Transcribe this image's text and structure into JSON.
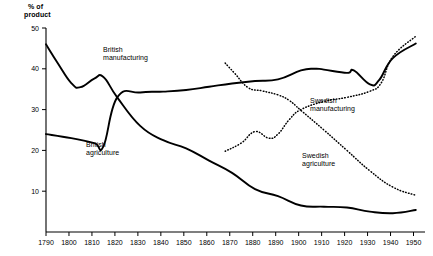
{
  "chart_data": {
    "type": "line",
    "title": "",
    "subtitle": "",
    "xlabel": "",
    "ylabel": "% of\nproduct",
    "ylabel_line1": "% of",
    "ylabel_line2": "product",
    "xlim": [
      1790,
      1955
    ],
    "ylim": [
      0,
      50
    ],
    "grid": false,
    "legend": "inline-annotations",
    "y_ticks": [
      10,
      20,
      30,
      40,
      50
    ],
    "y_tick_labels": [
      "10",
      "20",
      "30",
      "40",
      "50"
    ],
    "x_ticks": [
      1790,
      1800,
      1810,
      1820,
      1830,
      1840,
      1850,
      1860,
      1870,
      1880,
      1890,
      1900,
      1910,
      1920,
      1930,
      1940,
      1950
    ],
    "x_tick_labels": [
      "1790",
      "1800",
      "1810",
      "1820",
      "1830",
      "1840",
      "1850",
      "1860",
      "1870",
      "1880",
      "1890",
      "1900",
      "1910",
      "1920",
      "1930",
      "1940",
      "1950"
    ],
    "series": [
      {
        "name": "British agriculture",
        "style": "solid",
        "color": "#000000",
        "label_line1": "British",
        "label_line2": "agriculture",
        "x": [
          1790,
          1795,
          1801,
          1805,
          1811,
          1815,
          1821,
          1831,
          1841,
          1851,
          1861,
          1871,
          1881,
          1891,
          1901,
          1911,
          1921,
          1931,
          1941,
          1951
        ],
        "values": [
          46.0,
          41.5,
          36.5,
          35.5,
          37.6,
          38.0,
          33.0,
          26.0,
          22.5,
          20.5,
          17.5,
          14.5,
          10.5,
          8.8,
          6.5,
          6.2,
          6.0,
          5.0,
          4.6,
          5.4
        ]
      },
      {
        "name": "British manufacturing",
        "style": "solid",
        "color": "#000000",
        "label_line1": "British",
        "label_line2": "manufacturing",
        "x": [
          1790,
          1801,
          1811,
          1815,
          1821,
          1831,
          1841,
          1851,
          1861,
          1871,
          1881,
          1891,
          1901,
          1907,
          1911,
          1921,
          1924,
          1931,
          1935,
          1941,
          1951
        ],
        "values": [
          24.0,
          23.0,
          21.8,
          21.0,
          33.0,
          34.2,
          34.4,
          34.8,
          35.6,
          36.4,
          37.0,
          37.4,
          39.6,
          40.0,
          39.8,
          39.0,
          39.6,
          36.2,
          37.2,
          42.6,
          46.2
        ]
      },
      {
        "name": "Swedish agriculture",
        "style": "dotted",
        "color": "#000000",
        "label_line1": "Swedish",
        "label_line2": "agriculture",
        "x": [
          1868,
          1872,
          1878,
          1884,
          1891,
          1896,
          1901,
          1911,
          1921,
          1931,
          1941,
          1951
        ],
        "values": [
          41.4,
          39.0,
          35.4,
          34.6,
          33.6,
          32.2,
          29.8,
          25.0,
          20.0,
          15.0,
          11.0,
          9.0
        ]
      },
      {
        "name": "Swedish manufacturing",
        "style": "dotted",
        "color": "#000000",
        "label_line1": "Swedish",
        "label_line2": "manufacturing",
        "x": [
          1868,
          1875,
          1881,
          1887,
          1891,
          1896,
          1901,
          1911,
          1921,
          1931,
          1936,
          1941,
          1951
        ],
        "values": [
          19.8,
          21.8,
          24.6,
          23.0,
          24.0,
          27.6,
          30.0,
          32.0,
          33.0,
          34.5,
          36.6,
          43.0,
          48.0
        ]
      }
    ]
  },
  "axis": {
    "y_title_line1": "% of",
    "y_title_line2": "product"
  }
}
